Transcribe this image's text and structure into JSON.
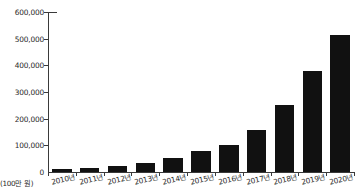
{
  "chart_data": {
    "type": "bar",
    "title": "",
    "xlabel": "",
    "ylabel": "",
    "unit_label": "(100만 원)",
    "grid": false,
    "legend": false,
    "ylim": [
      0,
      600000
    ],
    "ytick_labels": [
      "600,000",
      "500,000",
      "400,000",
      "300,000",
      "200,000",
      "100,000",
      "0"
    ],
    "ytick_values": [
      600000,
      500000,
      400000,
      300000,
      200000,
      100000,
      0
    ],
    "categories": [
      "2010년",
      "2011년",
      "2012년",
      "2013년",
      "2014년",
      "2015년",
      "2016년",
      "2017년",
      "2018년",
      "2019년",
      "2020년"
    ],
    "values": [
      11000,
      15000,
      22000,
      35000,
      52000,
      77000,
      101000,
      156000,
      250000,
      377000,
      512000
    ],
    "bar_color": "#111111",
    "axis_color": "#3a3a3a"
  }
}
